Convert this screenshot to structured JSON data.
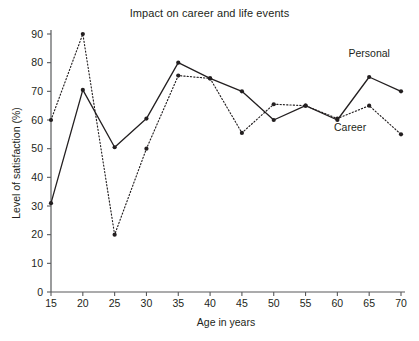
{
  "chart_data": {
    "type": "line",
    "title": "Impact on career and life events",
    "xlabel": "Age in years",
    "ylabel": "Level of satisfaction (%)",
    "x": [
      15,
      20,
      25,
      30,
      35,
      40,
      45,
      50,
      55,
      60,
      65,
      70
    ],
    "xtick_labels": [
      "15",
      "20",
      "25",
      "30",
      "35",
      "40",
      "45",
      "50",
      "55",
      "60",
      "65",
      "70"
    ],
    "ytick_labels": [
      "0",
      "10",
      "20",
      "30",
      "40",
      "50",
      "60",
      "70",
      "80",
      "90"
    ],
    "yticks": [
      0,
      10,
      20,
      30,
      40,
      50,
      60,
      70,
      80,
      90
    ],
    "xlim": [
      15,
      70
    ],
    "ylim": [
      0,
      90
    ],
    "grid": false,
    "legend_position": "inline-right",
    "series": [
      {
        "name": "Personal",
        "style": "solid",
        "color": "#231f20",
        "values": [
          31,
          70.5,
          50.5,
          60.5,
          80,
          74.5,
          70,
          60,
          65,
          60,
          75,
          70
        ]
      },
      {
        "name": "Career",
        "style": "dotted",
        "color": "#231f20",
        "values": [
          60,
          90,
          20,
          50,
          75.5,
          74.5,
          55.5,
          65.5,
          65,
          60.5,
          65,
          55
        ]
      }
    ],
    "annotations": [
      {
        "text": "Personal",
        "x": 65,
        "y": 82
      },
      {
        "text": "Career",
        "x": 62,
        "y": 56
      }
    ]
  }
}
